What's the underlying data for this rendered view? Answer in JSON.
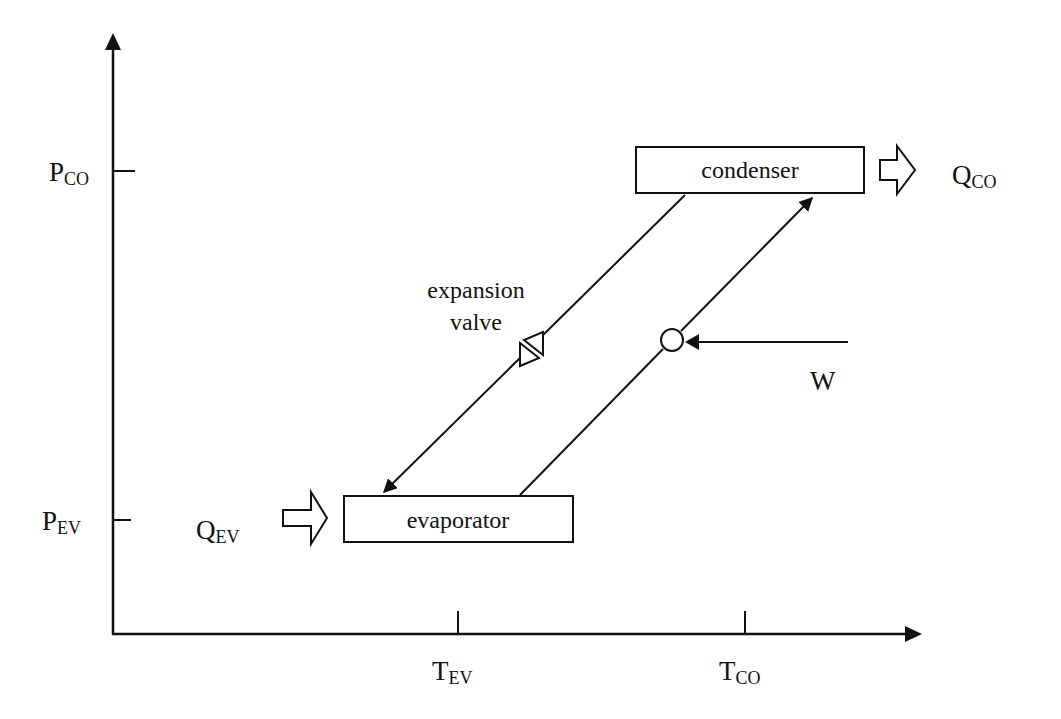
{
  "diagram": {
    "axes": {
      "y_axis": {
        "ticks": [
          {
            "main": "P",
            "sub": "CO"
          },
          {
            "main": "P",
            "sub": "EV"
          }
        ]
      },
      "x_axis": {
        "ticks": [
          {
            "main": "T",
            "sub": "EV"
          },
          {
            "main": "T",
            "sub": "CO"
          }
        ]
      }
    },
    "components": {
      "condenser": {
        "label": "condenser"
      },
      "evaporator": {
        "label": "evaporator"
      },
      "expansion_valve": {
        "label_line1": "expansion",
        "label_line2": "valve"
      },
      "compressor": {
        "symbol": "circle"
      }
    },
    "flows": {
      "q_co": {
        "main": "Q",
        "sub": "CO"
      },
      "q_ev": {
        "main": "Q",
        "sub": "EV"
      },
      "work": {
        "label": "W"
      }
    },
    "colors": {
      "stroke": "#111111",
      "background": "#ffffff"
    }
  }
}
